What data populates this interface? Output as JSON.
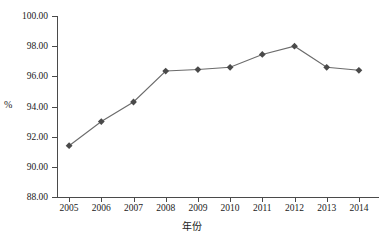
{
  "chart_data": {
    "type": "line",
    "title": "",
    "subtitle": "",
    "xlabel": "年份",
    "ylabel": "%",
    "categories": [
      "2005",
      "2006",
      "2007",
      "2008",
      "2009",
      "2010",
      "2011",
      "2012",
      "2013",
      "2014"
    ],
    "x": [
      2005,
      2006,
      2007,
      2008,
      2009,
      2010,
      2011,
      2012,
      2013,
      2014
    ],
    "values": [
      91.4,
      93.0,
      94.3,
      96.35,
      96.45,
      96.6,
      97.45,
      98.0,
      96.6,
      96.4
    ],
    "series": [
      {
        "name": "",
        "values": [
          91.4,
          93.0,
          94.3,
          96.35,
          96.45,
          96.6,
          97.45,
          98.0,
          96.6,
          96.4
        ],
        "color": "#595959",
        "marker": "diamond"
      }
    ],
    "ylim": [
      88.0,
      100.0
    ],
    "yticks": [
      88.0,
      90.0,
      92.0,
      94.0,
      96.0,
      98.0,
      100.0
    ],
    "ytick_labels": [
      "88.00",
      "90.00",
      "92.00",
      "94.00",
      "96.00",
      "98.00",
      "100.00"
    ],
    "xtick_labels": [
      "2005",
      "2006",
      "2007",
      "2008",
      "2009",
      "2010",
      "2011",
      "2012",
      "2013",
      "2014"
    ],
    "grid": false,
    "legend": false,
    "legend_position": "none",
    "annotations": [],
    "line_color": "#6b6b6b",
    "marker_color": "#4a4a4a",
    "axis_color": "#4a4a4a",
    "background": "#ffffff"
  }
}
